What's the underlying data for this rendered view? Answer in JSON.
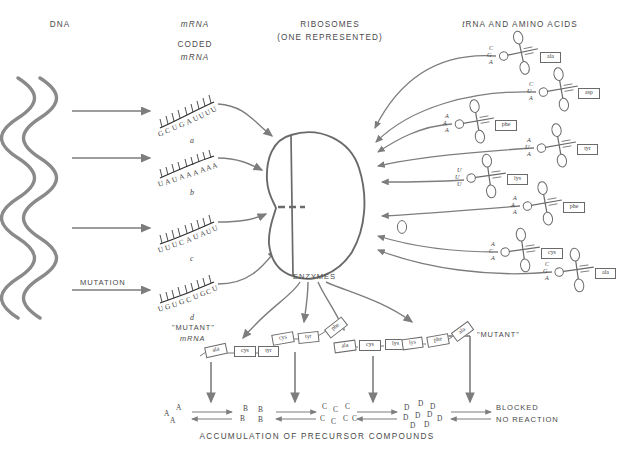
{
  "figure": {
    "bottom_caption": "ACCUMULATION OF PRECURSOR COMPOUNDS"
  },
  "headers": {
    "dna": "DNA",
    "mrna": "mRNA",
    "coded_line1": "CODED",
    "coded_line2": "mRNA",
    "ribosomes_line1": "RIBOSOMES",
    "ribosomes_line2": "(ONE REPRESENTED)",
    "trna": "tRNA AND AMINO ACIDS"
  },
  "labels": {
    "mutation": "MUTATION",
    "enzymes": "ENZYMES",
    "mutant_quoted": "\"MUTANT\"",
    "mutant_mrna_line1": "\"MUTANT\"",
    "mutant_mrna_line2": "mRNA",
    "blocked_line1": "BLOCKED",
    "blocked_line2": "NO REACTION"
  },
  "mrna_strands": [
    {
      "id": "a",
      "sequence": "GCUGAUUUU",
      "mutant": false
    },
    {
      "id": "b",
      "sequence": "UAUAAAAAA",
      "mutant": false
    },
    {
      "id": "c",
      "sequence": "UUUCAUAUU",
      "mutant": false
    },
    {
      "id": "d",
      "sequence": "UGUGCUGCU",
      "mutant": true
    }
  ],
  "trnas": [
    {
      "anticodon": "CGA",
      "amino_acid": "ala"
    },
    {
      "anticodon": "CUA",
      "amino_acid": "asp"
    },
    {
      "anticodon": "AAA",
      "amino_acid": "phe"
    },
    {
      "anticodon": "AUA",
      "amino_acid": "tyr"
    },
    {
      "anticodon": "UUU",
      "amino_acid": "lys"
    },
    {
      "anticodon": "AAA",
      "amino_acid": "phe"
    },
    {
      "anticodon": "ACA",
      "amino_acid": "cys"
    },
    {
      "anticodon": "CGA",
      "amino_acid": "ala"
    }
  ],
  "enzyme_chains": [
    {
      "residues": [
        "ala",
        "cys",
        "tyr"
      ],
      "mutant": false
    },
    {
      "residues": [
        "cys",
        "tyr",
        "phe"
      ],
      "mutant": false
    },
    {
      "residues": [
        "ala",
        "cys",
        "lys"
      ],
      "mutant": false
    },
    {
      "residues": [
        "lys",
        "phe",
        "ala"
      ],
      "mutant": true
    }
  ],
  "precursor_groups": [
    {
      "letter": "A",
      "count": 3
    },
    {
      "letter": "B",
      "count": 4
    },
    {
      "letter": "C",
      "count": 7
    },
    {
      "letter": "D",
      "count": 9
    }
  ],
  "colors": {
    "ink": "#4a4a4a",
    "helix": "#8a8a8a",
    "arrow": "#7d7d7d",
    "outline": "#6a6a6a",
    "background": "#ffffff"
  }
}
